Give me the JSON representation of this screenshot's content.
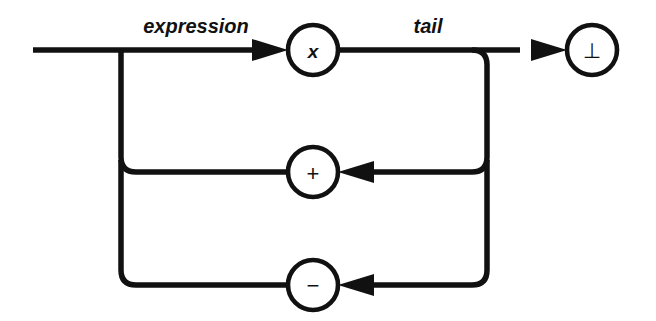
{
  "diagram": {
    "type": "railroad-syntax-diagram",
    "title": "expression",
    "background_color": "#ffffff",
    "line_color": "#111111",
    "canvas": {
      "width": 656,
      "height": 321
    },
    "edge_labels": [
      {
        "id": "expression",
        "text": "expression",
        "x": 196,
        "y": 33,
        "style": "italic"
      },
      {
        "id": "tail",
        "text": "tail",
        "x": 428,
        "y": 33,
        "style": "italic"
      }
    ],
    "nodes": [
      {
        "id": "node-x",
        "label": "x",
        "semantic": "nonterminal-x",
        "cx": 313,
        "cy": 50,
        "r": 25,
        "label_style": "italic"
      },
      {
        "id": "node-plus",
        "label": "+",
        "semantic": "terminal-plus",
        "cx": 313,
        "cy": 172,
        "r": 25,
        "label_style": "symbol"
      },
      {
        "id": "node-minus",
        "label": "−",
        "semantic": "terminal-minus",
        "cx": 313,
        "cy": 285,
        "r": 25,
        "label_style": "symbol"
      },
      {
        "id": "node-bottom",
        "label": "⊥",
        "semantic": "terminal-bottom-tack",
        "cx": 592,
        "cy": 50,
        "r": 25,
        "label_style": "bottom-tack"
      }
    ],
    "rails": {
      "entry_line": "M 33 50 L 247 50",
      "x_to_tail": "M 338 50 L 513 50",
      "left_branch_down": "M 121 50 L 121 157 Q 121 172 136 172 L 288 172",
      "left_branch_lower": "M 121 165 L 121 270 Q 121 285 136 285 L 288 285",
      "right_branch_down": "M 487 50 L 487 157 Q 487 172 472 172 L 390 172",
      "right_branch_lower": "M 487 165 L 487 270 Q 487 285 472 285 L 390 285",
      "top_right_corner": "M 472 50 Q 487 50 487 65"
    },
    "arrows": [
      {
        "id": "arrow-to-x",
        "direction": "right",
        "tip_x": 288,
        "tip_y": 50,
        "length": 36,
        "half_height": 11
      },
      {
        "id": "arrow-to-bottom",
        "direction": "right",
        "tip_x": 567,
        "tip_y": 50,
        "length": 36,
        "half_height": 11
      },
      {
        "id": "arrow-to-plus",
        "direction": "left",
        "tip_x": 338,
        "tip_y": 172,
        "length": 36,
        "half_height": 11
      },
      {
        "id": "arrow-to-minus",
        "direction": "left",
        "tip_x": 338,
        "tip_y": 285,
        "length": 36,
        "half_height": 11
      }
    ]
  }
}
